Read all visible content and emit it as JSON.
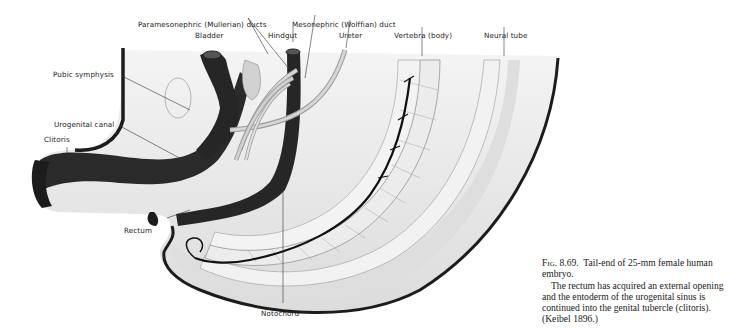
{
  "figure": {
    "labels": {
      "paramesonephric": "Paramesonephric (Mullerian) ducts",
      "mesonephric": "Mesonephric (Wolffian) duct",
      "bladder": "Bladder",
      "hindgut": "Hindgut",
      "ureter": "Ureter",
      "vertebra": "Vertebra (body)",
      "neural_tube": "Neural tube",
      "pubic_symphysis": "Pubic symphysis",
      "urogenital_canal": "Urogenital canal",
      "clitoris": "Clitoris",
      "rectum": "Rectum",
      "notochord": "Notochord"
    },
    "caption": {
      "fig_number": "Fig. 8.69.",
      "title": "Tail-end of 25-mm female human embryo.",
      "body": "The rectum has acquired an external opening and the entoderm of the urogenital sinus is continued into the genital tubercle (clitoris). (Keibel 1896.)"
    },
    "colors": {
      "ink": "#1c1c1c",
      "tissue": "#e6e6e6",
      "light_tissue": "#f1f1f1",
      "ducts": "#c9c9c9"
    }
  }
}
